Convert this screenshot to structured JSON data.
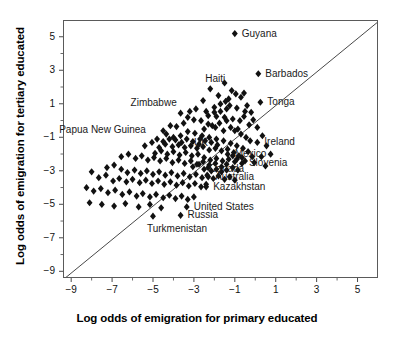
{
  "chart_data": {
    "type": "scatter",
    "title": "",
    "xlabel": "Log odds of emigration for primary educated",
    "ylabel": "Log odds of emigration for tertiary educated",
    "xlim": [
      -9.4,
      6.0
    ],
    "ylim": [
      -9.4,
      6.0
    ],
    "xticks": [
      -9,
      -7,
      -5,
      -3,
      -1,
      1,
      3,
      5
    ],
    "yticks": [
      -9,
      -7,
      -5,
      -3,
      -1,
      1,
      3,
      5
    ],
    "xtick_labels": [
      "−9",
      "−7",
      "−5",
      "−3",
      "−1",
      "1",
      "3",
      "5"
    ],
    "ytick_labels": [
      "−9",
      "−7",
      "−5",
      "−3",
      "−1",
      "1",
      "3",
      "5"
    ],
    "minor_ticks": true,
    "grid": false,
    "legend": "none",
    "marker": "diamond",
    "marker_color": "#111111",
    "marker_size": 3.6,
    "reference_line": {
      "label": "y = x",
      "from": [
        -9.4,
        -9.4
      ],
      "to": [
        6.0,
        6.0
      ],
      "color": "#333333"
    },
    "annotations": [
      {
        "label": "Guyana",
        "x": -1.05,
        "y": 5.25,
        "lx": 8,
        "ly": -4
      },
      {
        "label": "Barbados",
        "x": 0.1,
        "y": 2.85,
        "lx": 8,
        "ly": -4
      },
      {
        "label": "Haiti",
        "x": -2.25,
        "y": 1.95,
        "lx": -4,
        "ly": -14
      },
      {
        "label": "Tonga",
        "x": 0.2,
        "y": 1.15,
        "lx": 8,
        "ly": -4
      },
      {
        "label": "Zimbabwe",
        "x": -3.7,
        "y": 0.5,
        "lx": -49,
        "ly": -14
      },
      {
        "label": "Ireland",
        "x": 0.05,
        "y": -1.25,
        "lx": 8,
        "ly": -4
      },
      {
        "label": "Papua New Guinea",
        "x": -4.55,
        "y": -0.55,
        "lx": -103,
        "ly": -5
      },
      {
        "label": "UK",
        "x": -2.8,
        "y": -1.35,
        "lx": -4,
        "ly": -5
      },
      {
        "label": "Mexico",
        "x": -1.4,
        "y": -1.95,
        "lx": 8,
        "ly": -4
      },
      {
        "label": "Slovenia",
        "x": -0.7,
        "y": -2.5,
        "lx": 8,
        "ly": -4
      },
      {
        "label": "Canada",
        "x": -2.55,
        "y": -2.85,
        "lx": 6,
        "ly": -4
      },
      {
        "label": "Australia",
        "x": -2.35,
        "y": -3.3,
        "lx": 8,
        "ly": -4
      },
      {
        "label": "Kazakhstan",
        "x": -2.45,
        "y": -3.9,
        "lx": 8,
        "ly": -4
      },
      {
        "label": "United States",
        "x": -3.4,
        "y": -5.1,
        "lx": 8,
        "ly": -4
      },
      {
        "label": "Russia",
        "x": -3.7,
        "y": -5.6,
        "lx": 8,
        "ly": -4
      },
      {
        "label": "Turkmenistan",
        "x": -5.05,
        "y": -5.65,
        "lx": -5,
        "ly": 9
      }
    ],
    "points": [
      [
        -1.05,
        5.25
      ],
      [
        -2.25,
        1.95
      ],
      [
        0.1,
        2.85
      ],
      [
        0.2,
        1.15
      ],
      [
        -3.7,
        0.5
      ],
      [
        0.05,
        -1.25
      ],
      [
        -4.55,
        -0.55
      ],
      [
        -2.8,
        -1.35
      ],
      [
        -1.4,
        -1.95
      ],
      [
        -0.7,
        -2.5
      ],
      [
        -2.55,
        -2.85
      ],
      [
        -2.35,
        -3.3
      ],
      [
        -2.45,
        -3.9
      ],
      [
        -3.4,
        -5.1
      ],
      [
        -3.7,
        -5.6
      ],
      [
        -5.05,
        -5.65
      ],
      [
        -1.55,
        2.3
      ],
      [
        -1.0,
        1.65
      ],
      [
        -0.75,
        1.45
      ],
      [
        -1.35,
        1.35
      ],
      [
        -1.3,
        0.95
      ],
      [
        -0.95,
        0.8
      ],
      [
        -0.55,
        0.6
      ],
      [
        -1.75,
        1.05
      ],
      [
        -2.05,
        0.85
      ],
      [
        -2.45,
        0.6
      ],
      [
        -1.95,
        0.3
      ],
      [
        -1.55,
        0.25
      ],
      [
        -1.15,
        0.15
      ],
      [
        -0.8,
        0.05
      ],
      [
        -0.6,
        0.3
      ],
      [
        -0.35,
        -0.2
      ],
      [
        -0.9,
        -0.45
      ],
      [
        -1.25,
        -0.35
      ],
      [
        -1.6,
        -0.55
      ],
      [
        -2.0,
        -0.35
      ],
      [
        -2.35,
        -0.15
      ],
      [
        -2.7,
        0.05
      ],
      [
        -3.05,
        0.1
      ],
      [
        -3.35,
        0.25
      ],
      [
        -3.55,
        -0.1
      ],
      [
        -3.9,
        -0.3
      ],
      [
        -4.2,
        -0.25
      ],
      [
        -4.4,
        -0.75
      ],
      [
        -4.05,
        -0.95
      ],
      [
        -3.7,
        -0.85
      ],
      [
        -3.35,
        -0.6
      ],
      [
        -3.0,
        -0.7
      ],
      [
        -2.65,
        -0.85
      ],
      [
        -2.3,
        -0.95
      ],
      [
        -1.95,
        -1.05
      ],
      [
        -1.6,
        -1.15
      ],
      [
        -1.25,
        -1.3
      ],
      [
        -0.95,
        -1.45
      ],
      [
        -0.65,
        -1.6
      ],
      [
        -0.4,
        -1.8
      ],
      [
        -0.2,
        -2.1
      ],
      [
        -0.1,
        -2.45
      ],
      [
        0.25,
        -2.1
      ],
      [
        0.45,
        -2.65
      ],
      [
        -5.45,
        -1.45
      ],
      [
        -5.1,
        -1.25
      ],
      [
        -4.75,
        -1.55
      ],
      [
        -4.45,
        -1.35
      ],
      [
        -4.1,
        -1.5
      ],
      [
        -3.8,
        -1.4
      ],
      [
        -3.5,
        -1.55
      ],
      [
        -3.2,
        -1.45
      ],
      [
        -2.9,
        -1.6
      ],
      [
        -2.6,
        -1.5
      ],
      [
        -2.3,
        -1.7
      ],
      [
        -2.0,
        -1.6
      ],
      [
        -1.7,
        -1.75
      ],
      [
        -1.4,
        -1.65
      ],
      [
        -1.1,
        -1.85
      ],
      [
        -0.85,
        -2.05
      ],
      [
        -6.6,
        -2.1
      ],
      [
        -6.25,
        -1.95
      ],
      [
        -5.9,
        -2.2
      ],
      [
        -5.6,
        -2.05
      ],
      [
        -5.3,
        -2.3
      ],
      [
        -5.0,
        -2.15
      ],
      [
        -4.7,
        -2.35
      ],
      [
        -4.4,
        -2.2
      ],
      [
        -4.1,
        -2.45
      ],
      [
        -3.8,
        -2.3
      ],
      [
        -3.5,
        -2.5
      ],
      [
        -3.2,
        -2.35
      ],
      [
        -2.9,
        -2.55
      ],
      [
        -2.6,
        -2.4
      ],
      [
        -2.3,
        -2.6
      ],
      [
        -2.0,
        -2.5
      ],
      [
        -1.7,
        -2.7
      ],
      [
        -1.45,
        -2.55
      ],
      [
        -1.15,
        -2.75
      ],
      [
        -0.9,
        -2.9
      ],
      [
        -7.3,
        -2.75
      ],
      [
        -6.95,
        -2.6
      ],
      [
        -6.6,
        -2.85
      ],
      [
        -6.3,
        -3.05
      ],
      [
        -5.95,
        -2.9
      ],
      [
        -5.65,
        -3.1
      ],
      [
        -5.35,
        -2.95
      ],
      [
        -5.05,
        -3.15
      ],
      [
        -4.75,
        -3.0
      ],
      [
        -4.45,
        -3.2
      ],
      [
        -4.15,
        -3.05
      ],
      [
        -3.85,
        -3.25
      ],
      [
        -3.55,
        -3.1
      ],
      [
        -3.25,
        -3.3
      ],
      [
        -2.95,
        -3.15
      ],
      [
        -2.65,
        -3.35
      ],
      [
        -2.4,
        -3.2
      ],
      [
        -2.1,
        -3.4
      ],
      [
        -1.85,
        -3.25
      ],
      [
        -1.55,
        -3.45
      ],
      [
        -1.3,
        -3.3
      ],
      [
        -1.05,
        -3.5
      ],
      [
        -8.05,
        -3.0
      ],
      [
        -7.7,
        -3.35
      ],
      [
        -7.35,
        -3.2
      ],
      [
        -7.0,
        -3.55
      ],
      [
        -6.7,
        -3.4
      ],
      [
        -6.35,
        -3.6
      ],
      [
        -6.05,
        -3.45
      ],
      [
        -5.7,
        -3.65
      ],
      [
        -5.4,
        -3.5
      ],
      [
        -5.1,
        -3.7
      ],
      [
        -4.8,
        -3.55
      ],
      [
        -4.5,
        -3.75
      ],
      [
        -4.2,
        -3.6
      ],
      [
        -3.9,
        -3.8
      ],
      [
        -3.6,
        -3.65
      ],
      [
        -3.3,
        -3.85
      ],
      [
        -3.0,
        -3.7
      ],
      [
        -2.7,
        -3.9
      ],
      [
        -2.45,
        -3.75
      ],
      [
        -8.3,
        -3.95
      ],
      [
        -7.95,
        -4.15
      ],
      [
        -7.6,
        -4.0
      ],
      [
        -7.25,
        -4.25
      ],
      [
        -6.9,
        -4.1
      ],
      [
        -6.55,
        -4.35
      ],
      [
        -6.2,
        -4.2
      ],
      [
        -5.85,
        -4.45
      ],
      [
        -5.55,
        -4.3
      ],
      [
        -5.2,
        -4.5
      ],
      [
        -4.9,
        -4.35
      ],
      [
        -4.55,
        -4.55
      ],
      [
        -4.25,
        -4.4
      ],
      [
        -3.95,
        -4.6
      ],
      [
        -3.65,
        -4.45
      ],
      [
        -3.35,
        -4.65
      ],
      [
        -3.05,
        -4.5
      ],
      [
        -8.15,
        -4.85
      ],
      [
        -7.55,
        -4.95
      ],
      [
        -6.95,
        -5.05
      ],
      [
        -6.4,
        -4.9
      ],
      [
        -5.75,
        -5.1
      ],
      [
        -5.2,
        -4.95
      ],
      [
        -4.65,
        -5.15
      ],
      [
        -2.55,
        -0.45
      ],
      [
        -2.15,
        -0.25
      ],
      [
        -1.8,
        -0.1
      ],
      [
        -1.45,
        0.05
      ],
      [
        -1.05,
        -0.55
      ],
      [
        -0.75,
        -0.75
      ],
      [
        -0.5,
        -0.95
      ],
      [
        -0.3,
        -1.15
      ],
      [
        -2.85,
        -1.95
      ],
      [
        -2.55,
        -2.15
      ],
      [
        -2.25,
        -2.3
      ],
      [
        -1.95,
        -2.2
      ],
      [
        -1.65,
        -2.35
      ],
      [
        -1.35,
        -2.25
      ],
      [
        -1.05,
        -2.4
      ],
      [
        -3.15,
        -2.05
      ],
      [
        -3.45,
        -1.85
      ],
      [
        -3.75,
        -2.0
      ],
      [
        -4.05,
        -1.8
      ],
      [
        -4.35,
        -1.95
      ],
      [
        -4.65,
        -1.75
      ],
      [
        -4.95,
        -1.9
      ],
      [
        -2.05,
        0.55
      ],
      [
        -2.35,
        0.35
      ],
      [
        -1.75,
        0.6
      ],
      [
        -1.45,
        0.75
      ],
      [
        -0.45,
        0.95
      ],
      [
        -0.25,
        0.55
      ],
      [
        -0.15,
        0.1
      ],
      [
        0.05,
        -0.35
      ],
      [
        0.3,
        -0.85
      ],
      [
        0.5,
        -1.45
      ],
      [
        0.7,
        -1.95
      ],
      [
        -1.85,
        1.55
      ],
      [
        -1.5,
        1.2
      ],
      [
        -1.2,
        1.85
      ],
      [
        -0.6,
        1.7
      ],
      [
        -2.6,
        1.25
      ],
      [
        -2.95,
        0.75
      ],
      [
        -3.25,
        0.6
      ],
      [
        -1.9,
        -1.4
      ],
      [
        -2.2,
        -1.25
      ],
      [
        -2.5,
        -1.15
      ],
      [
        -2.75,
        -1.05
      ],
      [
        -3.1,
        -1.2
      ],
      [
        -3.4,
        -1.05
      ],
      [
        -3.65,
        -1.25
      ],
      [
        -3.95,
        -1.1
      ],
      [
        -4.25,
        -1.05
      ],
      [
        -4.55,
        -1.2
      ],
      [
        -4.85,
        -1.05
      ],
      [
        -1.15,
        -2.05
      ],
      [
        -0.95,
        -2.25
      ],
      [
        -0.7,
        -2.15
      ],
      [
        -0.55,
        -2.35
      ],
      [
        -1.95,
        -2.85
      ],
      [
        -2.2,
        -2.95
      ],
      [
        -1.7,
        -3.0
      ],
      [
        -1.45,
        -2.9
      ],
      [
        -2.8,
        -2.55
      ],
      [
        -3.1,
        -2.7
      ],
      [
        -2.35,
        -2.75
      ]
    ]
  }
}
